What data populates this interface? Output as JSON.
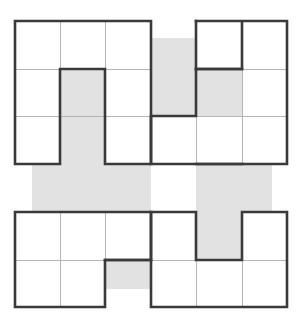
{
  "figure": {
    "name": "polyomino-grid-puzzle",
    "type": "grid-puzzle",
    "width": 301,
    "height": 324,
    "background_color": "#ffffff"
  },
  "grid": {
    "origin_x": 15,
    "origin_y": 21,
    "cell_width": 45.3,
    "cell_height": 47.7,
    "columns": 6,
    "rows": 6,
    "thick_border_color": "#3a3a3a",
    "thick_border_width": 2.6,
    "thin_line_color": "#b5b5b5",
    "thin_line_width": 1.0
  },
  "colors": {
    "shaded": "#e2e2e2",
    "shaded_stroke": "#d8d8d8",
    "white": "#ffffff",
    "outline": "#3a3a3a"
  },
  "cells": {
    "legend": {
      "0": "white",
      "1": "shaded",
      "2": "empty"
    },
    "rows": [
      [
        0,
        0,
        0,
        1,
        0,
        0
      ],
      [
        0,
        1,
        0,
        1,
        1,
        0
      ],
      [
        0,
        1,
        0,
        0,
        0,
        0
      ],
      [
        1,
        1,
        1,
        0,
        1,
        1
      ],
      [
        0,
        0,
        0,
        0,
        1,
        0
      ],
      [
        0,
        0,
        1,
        0,
        0,
        0
      ]
    ]
  },
  "shaded_regions": [
    {
      "name": "top-column-shape",
      "cells": [
        [
          1,
          1
        ],
        [
          2,
          1
        ]
      ]
    },
    {
      "name": "top-right-ell-shape",
      "cells": [
        [
          0,
          3
        ],
        [
          1,
          3
        ],
        [
          1,
          4
        ]
      ]
    },
    {
      "name": "middle-left-band",
      "cells": [
        [
          3,
          0
        ],
        [
          3,
          1
        ],
        [
          3,
          2
        ]
      ]
    },
    {
      "name": "middle-right-band",
      "cells": [
        [
          3,
          4
        ],
        [
          3,
          5
        ],
        [
          4,
          4
        ]
      ]
    },
    {
      "name": "bottom-nub",
      "cells": [
        [
          5,
          2
        ]
      ]
    }
  ],
  "overflow": {
    "left_band_start_x": 32,
    "right_band_end_x": 272,
    "top_nub_start_y": 38,
    "bottom_nub_end_y": 289
  }
}
